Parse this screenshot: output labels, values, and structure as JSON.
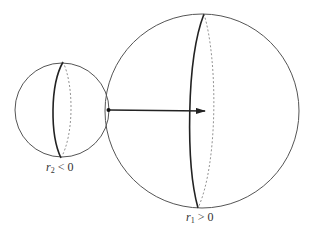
{
  "diagram": {
    "colors": {
      "stroke": "#555555",
      "meridian_front": "#222222",
      "meridian_back": "#777777",
      "arrow": "#222222",
      "background": "#ffffff"
    },
    "spheres": [
      {
        "id": "small",
        "cx": 62,
        "cy": 110,
        "r": 47,
        "label_var": "r",
        "label_sub": "2",
        "label_rel": "< 0"
      },
      {
        "id": "large",
        "cx": 202,
        "cy": 111,
        "r": 97,
        "label_var": "r",
        "label_sub": "1",
        "label_rel": "> 0"
      }
    ],
    "contact_point": {
      "x": 108,
      "y": 110
    },
    "arrow": {
      "x1": 108,
      "y1": 110,
      "x2": 206,
      "y2": 111
    }
  },
  "labels": {
    "small": {
      "var": "r",
      "sub": "2",
      "rel": " < 0"
    },
    "large": {
      "var": "r",
      "sub": "1",
      "rel": " > 0"
    }
  }
}
